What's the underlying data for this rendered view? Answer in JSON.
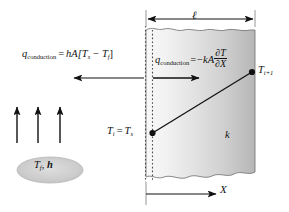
{
  "figure": {
    "wall": {
      "thickness_label": "ℓ",
      "conductivity_label": "k",
      "fill_light": "#f7f7f7",
      "fill_dark": "#b9b9b9"
    },
    "equations": {
      "convection": {
        "q_symbol": "q",
        "q_subscript": "conduction",
        "equals": "=",
        "rhs_prefix": "hA[T",
        "rhs_sub1": "s",
        "rhs_minus": "− T",
        "rhs_sub2": "f",
        "rhs_close": "]",
        "plain": "q_conduction = hA[T_s − T_f]"
      },
      "conduction": {
        "q_symbol": "q",
        "q_subscript": "conduction",
        "equals": "=",
        "sign": "−",
        "coefficient": "kA",
        "numerator": "∂T",
        "denominator": "∂X",
        "plain": "q_conduction = −kA ∂T/∂X"
      }
    },
    "labels": {
      "wall_thickness": "ℓ",
      "left_surface_temp_lhs": "T",
      "left_surface_temp_lhs_sub": "i",
      "left_surface_temp_eq": "=",
      "left_surface_temp_rhs": "T",
      "left_surface_temp_rhs_sub": "s",
      "left_surface_temp_plain": "T_i = T_s",
      "right_node_temp": "T",
      "right_node_temp_sub": "i+1",
      "right_node_temp_plain": "T_i+1",
      "conductivity": "k",
      "axis": "X",
      "fluid_temp": "T",
      "fluid_temp_sub": "f",
      "fluid_comma": ", ",
      "convection_coeff": "h",
      "fluid_plain": "T_f, h"
    },
    "icons": {
      "dimension_arrow": "double-headed-arrow-icon",
      "convection_arrow": "left-arrow-icon",
      "conduction_arrow": "right-arrow-icon",
      "flow_arrows": "up-arrow-icon",
      "axis_arrow": "right-arrow-icon",
      "node_marker": "filled-circle-icon",
      "fluid_region": "ellipse-icon"
    },
    "colors": {
      "line": "#111111",
      "dotted": "#555555",
      "ellipse_fill": "#cfcfcf",
      "ellipse_stroke": "#bdbdbd"
    }
  }
}
